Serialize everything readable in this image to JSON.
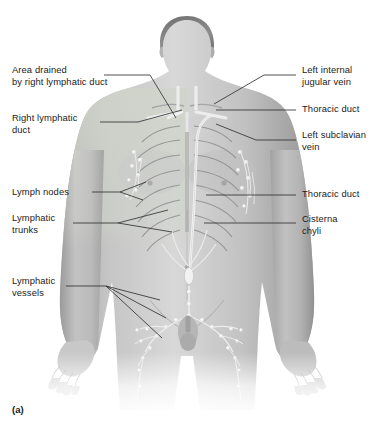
{
  "figure": {
    "caption": "(a)",
    "colors": {
      "background": "#ffffff",
      "skin_light": "#d9d9d9",
      "skin_mid": "#b8b8b8",
      "skin_shadow": "#8e8e8e",
      "drained_area_tint": "#c9cfc6",
      "vessel": "#f2f2f2",
      "node": "#fafafa",
      "leader_line": "#333333",
      "label_text": "#222222"
    }
  },
  "labels": {
    "left": [
      {
        "id": "area-drained-right-duct",
        "text": "Area drained\nby right lymphatic duct",
        "x": 12,
        "y": 70
      },
      {
        "id": "right-lymphatic-duct",
        "text": "Right lymphatic\nduct",
        "x": 12,
        "y": 118
      },
      {
        "id": "lymph-nodes",
        "text": "Lymph nodes",
        "x": 12,
        "y": 188
      },
      {
        "id": "lymphatic-trunks",
        "text": "Lymphatic\ntrunks",
        "x": 12,
        "y": 218
      },
      {
        "id": "lymphatic-vessels",
        "text": "Lymphatic\nvessels",
        "x": 12,
        "y": 281
      }
    ],
    "right": [
      {
        "id": "left-internal-jugular-vein",
        "text": "Left internal\njugular vein",
        "x": 302,
        "y": 70
      },
      {
        "id": "thoracic-duct-upper",
        "text": "Thoracic duct",
        "x": 302,
        "y": 105
      },
      {
        "id": "left-subclavian-vein",
        "text": "Left subclavian\nvein",
        "x": 302,
        "y": 135
      },
      {
        "id": "thoracic-duct-lower",
        "text": "Thoracic duct",
        "x": 302,
        "y": 190
      },
      {
        "id": "cisterna-chyli",
        "text": "Cisterna\nchyli",
        "x": 302,
        "y": 218
      }
    ]
  },
  "leaders": {
    "area-drained-right-duct": [
      [
        104,
        75
      ],
      [
        150,
        75
      ],
      [
        176,
        118
      ]
    ],
    "right-lymphatic-duct": [
      [
        100,
        122
      ],
      [
        138,
        122
      ],
      [
        182,
        110
      ]
    ],
    "lymph-nodes": [
      [
        92,
        192
      ],
      [
        120,
        192
      ],
      [
        146,
        182
      ]
    ],
    "lymph-nodes-b": [
      [
        92,
        192
      ],
      [
        120,
        192
      ],
      [
        143,
        200
      ]
    ],
    "lymphatic-trunks": [
      [
        73,
        223
      ],
      [
        118,
        223
      ],
      [
        168,
        210
      ]
    ],
    "lymphatic-trunks-b": [
      [
        73,
        223
      ],
      [
        118,
        223
      ],
      [
        172,
        232
      ]
    ],
    "lymphatic-vessels-a": [
      [
        66,
        286
      ],
      [
        106,
        286
      ],
      [
        160,
        300
      ]
    ],
    "lymphatic-vessels-b": [
      [
        66,
        286
      ],
      [
        106,
        286
      ],
      [
        166,
        318
      ]
    ],
    "lymphatic-vessels-c": [
      [
        66,
        286
      ],
      [
        106,
        286
      ],
      [
        162,
        338
      ]
    ],
    "left-internal-jugular-vein": [
      [
        296,
        75
      ],
      [
        264,
        75
      ],
      [
        214,
        104
      ]
    ],
    "thoracic-duct-upper": [
      [
        296,
        110
      ],
      [
        216,
        110
      ]
    ],
    "left-subclavian-vein": [
      [
        296,
        140
      ],
      [
        256,
        140
      ],
      [
        216,
        124
      ]
    ],
    "thoracic-duct-lower": [
      [
        296,
        195
      ],
      [
        206,
        195
      ]
    ],
    "cisterna-chyli": [
      [
        296,
        223
      ],
      [
        204,
        223
      ]
    ]
  }
}
